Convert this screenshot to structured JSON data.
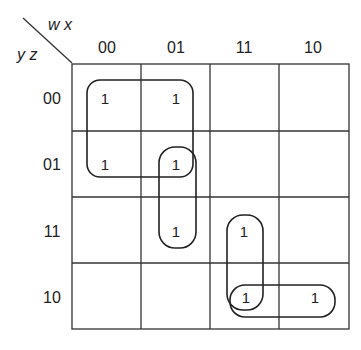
{
  "variables": {
    "column_vars": "w x",
    "row_vars": "y z"
  },
  "columns": [
    "00",
    "01",
    "11",
    "10"
  ],
  "rows": [
    "00",
    "01",
    "11",
    "10"
  ],
  "cells": [
    [
      "1",
      "1",
      "",
      ""
    ],
    [
      "1",
      "1",
      "",
      ""
    ],
    [
      "",
      "1",
      "1",
      ""
    ],
    [
      "",
      "",
      "1",
      "1"
    ]
  ],
  "groups": [
    {
      "name": "quad-w0-y0",
      "cells": [
        [
          0,
          0
        ],
        [
          0,
          1
        ],
        [
          1,
          0
        ],
        [
          1,
          1
        ]
      ]
    },
    {
      "name": "pair-col01-rows01-11",
      "cells": [
        [
          1,
          1
        ],
        [
          2,
          1
        ]
      ]
    },
    {
      "name": "pair-col11-rows11-10",
      "cells": [
        [
          2,
          2
        ],
        [
          3,
          2
        ]
      ]
    },
    {
      "name": "pair-row10-cols11-10",
      "cells": [
        [
          3,
          2
        ],
        [
          3,
          3
        ]
      ]
    }
  ]
}
